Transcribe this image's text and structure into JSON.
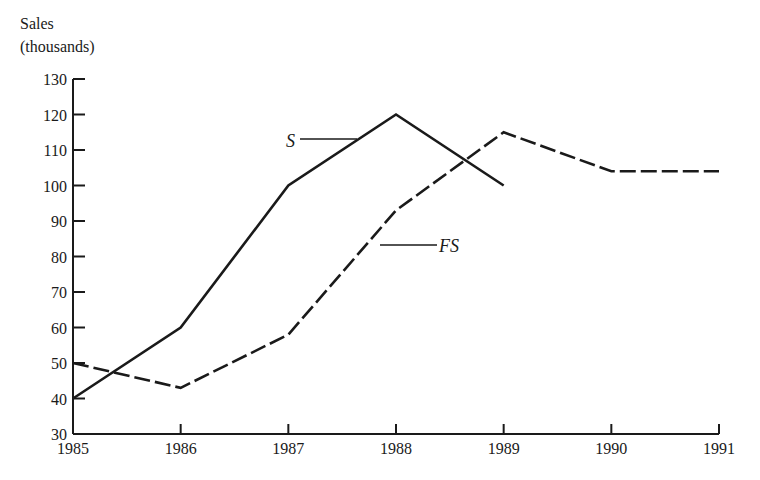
{
  "chart_data": {
    "type": "line",
    "title": "",
    "xlabel": "",
    "ylabel": "Sales (thousands)",
    "ylabel_lines": [
      "Sales",
      "(thousands)"
    ],
    "x": [
      1985,
      1986,
      1987,
      1988,
      1989,
      1990,
      1991
    ],
    "x_tick_labels": [
      "1985",
      "1986",
      "1987",
      "1988",
      "1989",
      "1990",
      "1991"
    ],
    "y_ticks": [
      30,
      40,
      50,
      60,
      70,
      80,
      90,
      100,
      110,
      120,
      130
    ],
    "y_tick_labels": [
      "30",
      "40",
      "50",
      "60",
      "70",
      "80",
      "90",
      "100",
      "110",
      "120",
      "130"
    ],
    "ylim": [
      30,
      130
    ],
    "xlim": [
      1985,
      1991
    ],
    "grid": false,
    "legend": "inline labels",
    "series": [
      {
        "name": "S",
        "style": "solid",
        "x": [
          1985,
          1986,
          1987,
          1988,
          1989
        ],
        "values": [
          40,
          60,
          100,
          120,
          100
        ]
      },
      {
        "name": "FS",
        "style": "dashed",
        "x": [
          1985,
          1986,
          1987,
          1988,
          1989,
          1990,
          1991
        ],
        "values": [
          50,
          43,
          58,
          93,
          115,
          104,
          104
        ]
      }
    ],
    "annotations": [
      {
        "text": "S",
        "series": "S"
      },
      {
        "text": "FS",
        "series": "FS"
      }
    ]
  },
  "colors": {
    "ink": "#1a1a1a",
    "background": "#ffffff"
  }
}
